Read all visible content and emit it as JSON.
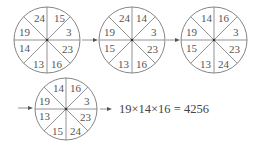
{
  "diagram": {
    "sector_order": [
      "top-right",
      "right-upper",
      "right-lower",
      "bottom-right",
      "bottom-left",
      "left-lower",
      "left-upper",
      "top-left"
    ],
    "circles": [
      {
        "id": "step-1",
        "sectors": [
          "15",
          "3",
          "23",
          "16",
          "13",
          "14",
          "19",
          "24"
        ]
      },
      {
        "id": "step-2",
        "sectors": [
          "14",
          "3",
          "23",
          "16",
          "13",
          "15",
          "19",
          "24"
        ]
      },
      {
        "id": "step-3",
        "sectors": [
          "16",
          "3",
          "23",
          "24",
          "13",
          "15",
          "19",
          "14"
        ]
      },
      {
        "id": "step-4",
        "sectors": [
          "16",
          "3",
          "23",
          "24",
          "15",
          "13",
          "19",
          "14"
        ]
      }
    ],
    "result_equation": "19×14×16 = 4256",
    "arrows": [
      "right-arrow",
      "right-arrow",
      "right-arrow",
      "right-arrow"
    ]
  }
}
